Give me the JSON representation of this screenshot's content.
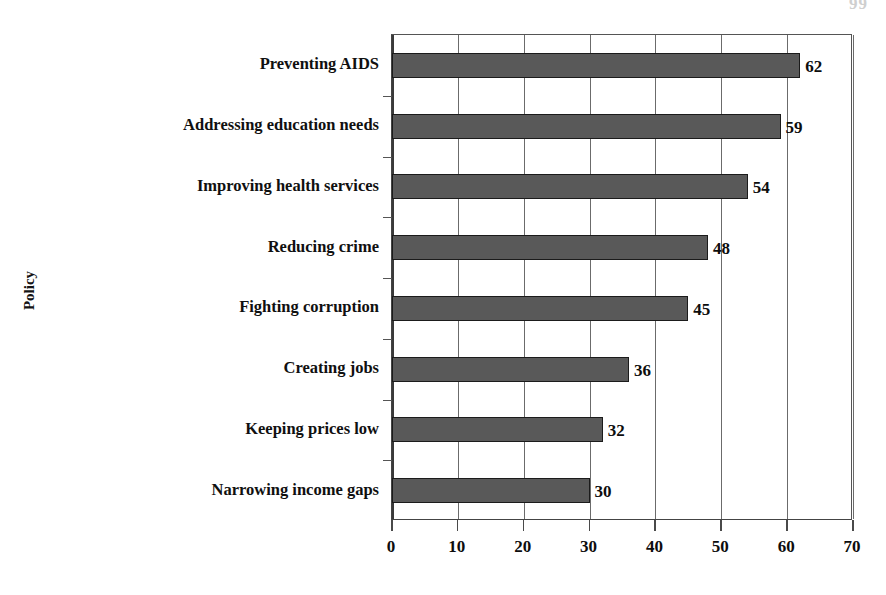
{
  "page": {
    "number_fragment": "99"
  },
  "chart_data": {
    "type": "bar",
    "orientation": "horizontal",
    "title": "",
    "xlabel": "",
    "ylabel": "Policy",
    "categories": [
      "Preventing AIDS",
      "Addressing education needs",
      "Improving health services",
      "Reducing crime",
      "Fighting corruption",
      "Creating jobs",
      "Keeping prices low",
      "Narrowing income gaps"
    ],
    "values": [
      62,
      59,
      54,
      48,
      45,
      36,
      32,
      30
    ],
    "data_labels": [
      "62",
      "59",
      "54",
      "48",
      "45",
      "36",
      "32",
      "30"
    ],
    "xlim": [
      0,
      70
    ],
    "xticks": [
      0,
      10,
      20,
      30,
      40,
      50,
      60,
      70
    ],
    "xtick_labels": [
      "0",
      "10",
      "20",
      "30",
      "40",
      "50",
      "60",
      "70"
    ],
    "grid": "vertical",
    "legend": "none",
    "bar_color": "#595959",
    "bar_border_color": "#1b1b1b",
    "axis_color": "#4a4a4a",
    "text_color": "#0d0d0d"
  }
}
